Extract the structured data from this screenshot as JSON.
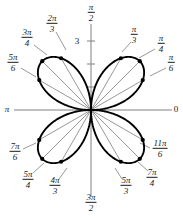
{
  "figure": {
    "kind": "polar-rose-plot",
    "background_color": "#ffffff",
    "curve_color": "#000000",
    "axis_color": "#808080",
    "radial_line_color": "#8c8c8c",
    "dot_color": "#000000",
    "text_color": "#1a1a1a"
  },
  "axis_labels": {
    "right": "0",
    "left": {
      "num": "π",
      "den": ""
    },
    "top": {
      "num": "π",
      "den": "2"
    },
    "bottom": {
      "num": "3π",
      "den": "2"
    }
  },
  "radial_tick_label": "3",
  "angle_labels": [
    {
      "id": "pi-over-6",
      "num": "π",
      "den": "6",
      "x": 171,
      "y": 63,
      "leader": [
        166,
        68,
        150,
        76
      ]
    },
    {
      "id": "pi-over-4",
      "num": "π",
      "den": "4",
      "x": 161,
      "y": 44,
      "leader": [
        155,
        49,
        139,
        58
      ]
    },
    {
      "id": "pi-over-3",
      "num": "π",
      "den": "3",
      "x": 134,
      "y": 35,
      "leader": [
        131,
        42,
        122,
        52
      ]
    },
    {
      "id": "2pi-over-3",
      "num": "2π",
      "den": "3",
      "x": 52,
      "y": 24,
      "leader": [
        56,
        32,
        66,
        50
      ]
    },
    {
      "id": "3pi-over-4",
      "num": "3π",
      "den": "4",
      "x": 27,
      "y": 38,
      "leader": [
        34,
        45,
        47,
        55
      ]
    },
    {
      "id": "5pi-over-6",
      "num": "5π",
      "den": "6",
      "x": 13,
      "y": 63,
      "leader": [
        21,
        68,
        36,
        77
      ]
    },
    {
      "id": "7pi-over-6",
      "num": "7π",
      "den": "6",
      "x": 15,
      "y": 152,
      "leader": [
        23,
        149,
        36,
        143
      ]
    },
    {
      "id": "5pi-over-4",
      "num": "5π",
      "den": "4",
      "x": 28,
      "y": 180,
      "leader": [
        33,
        173,
        44,
        163
      ]
    },
    {
      "id": "4pi-over-3",
      "num": "4π",
      "den": "3",
      "x": 55,
      "y": 186,
      "leader": [
        59,
        179,
        67,
        168
      ]
    },
    {
      "id": "5pi-over-3",
      "num": "5π",
      "den": "3",
      "x": 126,
      "y": 186,
      "leader": [
        122,
        179,
        115,
        168
      ]
    },
    {
      "id": "7pi-over-4",
      "num": "7π",
      "den": "4",
      "x": 152,
      "y": 178,
      "leader": [
        148,
        171,
        138,
        162
      ]
    },
    {
      "id": "11pi-over-6",
      "num": "11π",
      "den": "6",
      "x": 160,
      "y": 149,
      "leader": [
        150,
        148,
        140,
        143
      ]
    }
  ],
  "chart_data": {
    "type": "line",
    "subtype": "polar-rose",
    "equation": "r = 3 sin(2θ)",
    "petal_count": 4,
    "max_radius": 3,
    "radial_ticks": [
      1,
      2,
      3
    ],
    "radial_tick_labeled": [
      3
    ],
    "title": "",
    "xlabel": "",
    "ylabel": "",
    "grid": false,
    "legend": null,
    "theta_unit": "radians",
    "angle_tick_values": [
      "0",
      "π/6",
      "π/4",
      "π/3",
      "π/2",
      "2π/3",
      "3π/4",
      "5π/6",
      "π",
      "7π/6",
      "5π/4",
      "4π/3",
      "3π/2",
      "5π/3",
      "7π/4",
      "11π/6"
    ],
    "marked_points": [
      {
        "theta": "π/6",
        "r": 2.598
      },
      {
        "theta": "π/4",
        "r": 3.0
      },
      {
        "theta": "π/3",
        "r": 2.598
      },
      {
        "theta": "2π/3",
        "r": 2.598
      },
      {
        "theta": "3π/4",
        "r": 3.0
      },
      {
        "theta": "5π/6",
        "r": 2.598
      },
      {
        "theta": "7π/6",
        "r": 2.598
      },
      {
        "theta": "5π/4",
        "r": 3.0
      },
      {
        "theta": "4π/3",
        "r": 2.598
      },
      {
        "theta": "5π/3",
        "r": 2.598
      },
      {
        "theta": "7π/4",
        "r": 3.0
      },
      {
        "theta": "11π/6",
        "r": 2.598
      }
    ],
    "geometry": {
      "center_x": 91,
      "center_y": 110,
      "px_per_unit": 23
    }
  }
}
